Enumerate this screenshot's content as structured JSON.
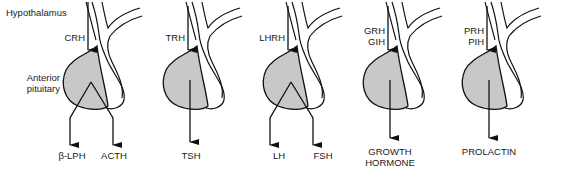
{
  "diagram": {
    "side_labels": {
      "hypothalamus": "Hypothalamus",
      "anterior_pituitary_line1": "Anterior",
      "anterior_pituitary_line2": "pituitary"
    },
    "colors": {
      "anterior_fill": "#c8c8c8",
      "stroke": "#111111",
      "background": "#ffffff"
    },
    "units": [
      {
        "releasing_hormones": [
          "CRH"
        ],
        "outputs": [
          "β-LPH",
          "ACTH"
        ]
      },
      {
        "releasing_hormones": [
          "TRH"
        ],
        "outputs": [
          "TSH"
        ]
      },
      {
        "releasing_hormones": [
          "LHRH"
        ],
        "outputs": [
          "LH",
          "FSH"
        ]
      },
      {
        "releasing_hormones": [
          "GRH",
          "GIH"
        ],
        "outputs": [
          "GROWTH",
          "HORMONE"
        ]
      },
      {
        "releasing_hormones": [
          "PRH",
          "PIH"
        ],
        "outputs": [
          "PROLACTIN"
        ]
      }
    ]
  }
}
